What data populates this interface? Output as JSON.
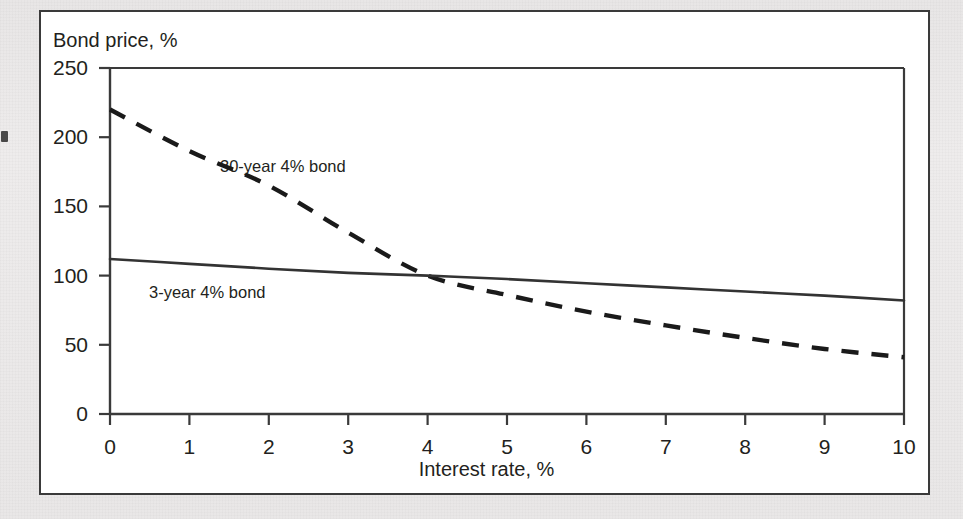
{
  "figure": {
    "background_color": "#ffffff",
    "frame_color": "#3a3a3a",
    "page_color": "#eceaea",
    "ink_color": "#231f20"
  },
  "chart_data": {
    "type": "line",
    "title": "",
    "xlabel": "Interest rate, %",
    "ylabel": "Bond price, %",
    "xlim": [
      0,
      10
    ],
    "ylim": [
      0,
      250
    ],
    "xticks": [
      0,
      1,
      2,
      3,
      4,
      5,
      6,
      7,
      8,
      9,
      10
    ],
    "xtick_labels": [
      "0",
      "1",
      "2",
      "3",
      "4",
      "5",
      "6",
      "7",
      "8",
      "9",
      "10"
    ],
    "yticks": [
      0,
      50,
      100,
      150,
      200,
      250
    ],
    "ytick_labels": [
      "0",
      "50",
      "100",
      "150",
      "200",
      "250"
    ],
    "grid": false,
    "legend": "inline-annotations",
    "x": [
      0,
      1,
      2,
      3,
      4,
      5,
      6,
      7,
      8,
      9,
      10
    ],
    "series": [
      {
        "name": "30-year 4% bond",
        "style": "dashed",
        "color": "#1a1a1a",
        "label_position": {
          "x": 1.4,
          "y": 178
        },
        "values": [
          220,
          190,
          165,
          131,
          100,
          86,
          74,
          64,
          55,
          47,
          41
        ]
      },
      {
        "name": "3-year 4% bond",
        "style": "solid",
        "color": "#333333",
        "label_position": {
          "x": 0.1,
          "y": 96
        },
        "values": [
          112,
          108.5,
          105,
          102,
          100,
          97.5,
          94.5,
          91.5,
          88.5,
          85.5,
          82
        ]
      }
    ],
    "annotations": [
      {
        "text": "30-year 4% bond",
        "series": "30-year 4% bond"
      },
      {
        "text": "3-year 4% bond",
        "series": "3-year 4% bond"
      }
    ],
    "crossover": {
      "x": 4,
      "y": 100,
      "note": "both bonds priced at par when rate equals 4% coupon"
    }
  }
}
